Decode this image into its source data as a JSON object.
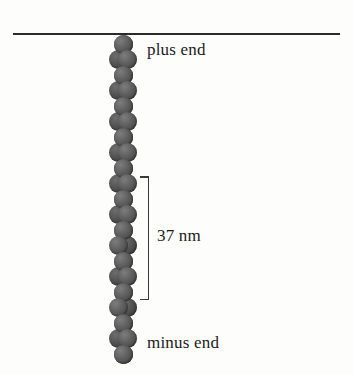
{
  "figure": {
    "background_color": "#fdfdfc",
    "width": 353,
    "height": 375
  },
  "top_rule": {
    "name": "horizontal-divider",
    "color": "#2b2b2b",
    "x_start": 13,
    "x_end": 340,
    "y": 33
  },
  "labels": {
    "plus_end": "plus end",
    "minus_end": "minus end",
    "scale": "37 nm"
  },
  "bracket": {
    "measurement": "37 nm",
    "y_top": 176,
    "y_bottom": 300,
    "color": "#3a3a3a"
  },
  "filament": {
    "description": "two-stranded helical polymer of globular subunits",
    "subunit_color": "#5a5a5a",
    "strand_count": 2,
    "bead_diameter": 19,
    "bead_pitch": 15.5,
    "helical_repeat_px": 62,
    "top_y": 44,
    "bottom_y": 352,
    "center_x": 123,
    "max_strand_separation": 9.5
  }
}
